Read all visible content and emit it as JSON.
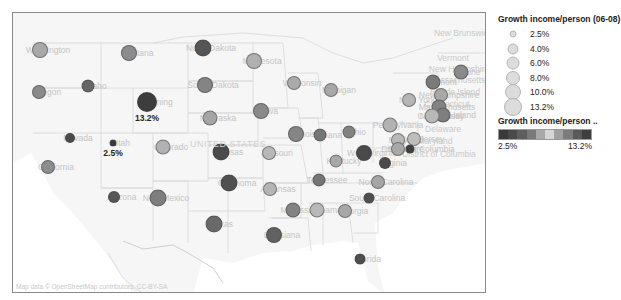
{
  "title_fragment": "Growth Income/Person — Average Growth Rate by State",
  "map": {
    "country_label": "UNITED STATES",
    "attribution": "Map data © OpenStreetMap contributors, CC-BY-SA",
    "extra_labels": [
      {
        "text": "Vermont",
        "x": 452,
        "y": 57
      },
      {
        "text": "New Hampshire",
        "x": 458,
        "y": 68
      },
      {
        "text": "Massachusetts",
        "x": 456,
        "y": 79
      },
      {
        "text": "Rhode Island",
        "x": 454,
        "y": 91
      },
      {
        "text": "Connecticut",
        "x": 446,
        "y": 103
      },
      {
        "text": "New Jersey",
        "x": 441,
        "y": 115
      },
      {
        "text": "Delaware",
        "x": 442,
        "y": 128
      },
      {
        "text": "Maryland",
        "x": 434,
        "y": 140
      },
      {
        "text": "District of Columbia",
        "x": 438,
        "y": 153
      },
      {
        "text": "New Brunswick",
        "x": 462,
        "y": 32
      }
    ],
    "states": [
      {
        "name": "Washington",
        "x": 39,
        "y": 49,
        "value": 7.0,
        "r": 8,
        "color": "#a8a8a8"
      },
      {
        "name": "Oregon",
        "x": 38,
        "y": 91,
        "value": 5.5,
        "r": 7,
        "color": "#8a8a8a"
      },
      {
        "name": "California",
        "x": 47,
        "y": 166,
        "value": 6.0,
        "r": 7,
        "color": "#8d8d8d"
      },
      {
        "name": "Nevada",
        "x": 69,
        "y": 137,
        "value": 3.5,
        "r": 5,
        "color": "#4a4a4a"
      },
      {
        "name": "Idaho",
        "x": 87,
        "y": 85,
        "value": 5.0,
        "r": 6.5,
        "color": "#656565"
      },
      {
        "name": "Montana",
        "x": 128,
        "y": 52,
        "value": 7.5,
        "r": 8,
        "color": "#8c8c8c"
      },
      {
        "name": "Wyoming",
        "x": 146,
        "y": 101,
        "value": 13.2,
        "r": 10,
        "color": "#3d3d3d",
        "label": "13.2%"
      },
      {
        "name": "Utah",
        "x": 112,
        "y": 142,
        "value": 2.5,
        "r": 3.5,
        "color": "#3a3a3a",
        "label": "2.5%"
      },
      {
        "name": "Colorado",
        "x": 162,
        "y": 146,
        "value": 7.0,
        "r": 7.5,
        "color": "#b2b2b2"
      },
      {
        "name": "Arizona",
        "x": 113,
        "y": 196,
        "value": 4.5,
        "r": 6,
        "color": "#575757"
      },
      {
        "name": "New Mexico",
        "x": 157,
        "y": 197,
        "value": 8.0,
        "r": 8.5,
        "color": "#7e7e7e"
      },
      {
        "name": "North Dakota",
        "x": 202,
        "y": 47,
        "value": 9.5,
        "r": 8.5,
        "color": "#555555"
      },
      {
        "name": "South Dakota",
        "x": 204,
        "y": 84,
        "value": 8.0,
        "r": 8,
        "color": "#848484"
      },
      {
        "name": "Nebraska",
        "x": 209,
        "y": 117,
        "value": 7.0,
        "r": 7.5,
        "color": "#a5a5a5"
      },
      {
        "name": "Kansas",
        "x": 220,
        "y": 151,
        "value": 10.0,
        "r": 8.5,
        "color": "#4a4a4a"
      },
      {
        "name": "Oklahoma",
        "x": 228,
        "y": 182,
        "value": 10.5,
        "r": 8.5,
        "color": "#505050"
      },
      {
        "name": "Texas",
        "x": 213,
        "y": 223,
        "value": 9.0,
        "r": 8.5,
        "color": "#6a6a6a"
      },
      {
        "name": "Minnesota",
        "x": 253,
        "y": 60,
        "value": 7.5,
        "r": 8,
        "color": "#b0b0b0"
      },
      {
        "name": "Iowa",
        "x": 260,
        "y": 110,
        "value": 8.0,
        "r": 8,
        "color": "#8a8a8a"
      },
      {
        "name": "Missouri",
        "x": 268,
        "y": 152,
        "value": 6.5,
        "r": 7,
        "color": "#b8b8b8"
      },
      {
        "name": "Arkansas",
        "x": 269,
        "y": 188,
        "value": 6.5,
        "r": 7,
        "color": "#b5b5b5"
      },
      {
        "name": "Louisiana",
        "x": 273,
        "y": 234,
        "value": 9.5,
        "r": 8,
        "color": "#616161"
      },
      {
        "name": "Wisconsin",
        "x": 293,
        "y": 82,
        "value": 7.0,
        "r": 7,
        "color": "#aaaaaa"
      },
      {
        "name": "Illinois",
        "x": 295,
        "y": 133,
        "value": 8.0,
        "r": 8,
        "color": "#868686"
      },
      {
        "name": "Indiana",
        "x": 319,
        "y": 134,
        "value": 6.0,
        "r": 6.5,
        "color": "#767676"
      },
      {
        "name": "Michigan",
        "x": 330,
        "y": 89,
        "value": 6.5,
        "r": 7,
        "color": "#a8a8a8"
      },
      {
        "name": "Ohio",
        "x": 348,
        "y": 131,
        "value": 6.0,
        "r": 6.5,
        "color": "#838383"
      },
      {
        "name": "Kentucky",
        "x": 335,
        "y": 160,
        "value": 6.0,
        "r": 6.5,
        "color": "#a8a8a8"
      },
      {
        "name": "Tennessee",
        "x": 318,
        "y": 179,
        "value": 6.0,
        "r": 6.5,
        "color": "#757575"
      },
      {
        "name": "Mississippi",
        "x": 292,
        "y": 209,
        "value": 8.0,
        "r": 7.5,
        "color": "#838383"
      },
      {
        "name": "Alabama",
        "x": 316,
        "y": 209,
        "value": 7.5,
        "r": 7.5,
        "color": "#b8b8b8"
      },
      {
        "name": "Georgia",
        "x": 344,
        "y": 210,
        "value": 7.0,
        "r": 7,
        "color": "#a8a8a8"
      },
      {
        "name": "Florida",
        "x": 359,
        "y": 258,
        "value": 4.5,
        "r": 5.5,
        "color": "#4e4e4e"
      },
      {
        "name": "South Carolina",
        "x": 368,
        "y": 197,
        "value": 4.5,
        "r": 5.5,
        "color": "#4e4e4e"
      },
      {
        "name": "North Carolina",
        "x": 377,
        "y": 181,
        "value": 7.0,
        "r": 7,
        "color": "#a5a5a5"
      },
      {
        "name": "Virginia",
        "x": 384,
        "y": 162,
        "value": 5.0,
        "r": 6,
        "color": "#4a4a4a"
      },
      {
        "name": "West Virginia",
        "x": 363,
        "y": 152,
        "value": 9.0,
        "r": 8,
        "color": "#4a4a4a"
      },
      {
        "name": "Pennsylvania",
        "x": 389,
        "y": 124,
        "value": 7.0,
        "r": 7.5,
        "color": "#b2b2b2"
      },
      {
        "name": "Maryland",
        "x": 397,
        "y": 139,
        "value": 6.5,
        "r": 7,
        "color": "#b8b8b8"
      },
      {
        "name": "Delaware",
        "x": 397,
        "y": 148,
        "value": 6.5,
        "r": 7,
        "color": "#a8a8a8"
      },
      {
        "name": "New Jersey",
        "x": 413,
        "y": 138,
        "value": 7.0,
        "r": 7,
        "color": "#bdbdbd"
      },
      {
        "name": "District of Columbia",
        "x": 409,
        "y": 148,
        "value": 3.5,
        "r": 4.5,
        "color": "#3f3f3f"
      },
      {
        "name": "New York",
        "x": 408,
        "y": 99,
        "value": 7.0,
        "r": 7,
        "color": "#b5b5b5"
      },
      {
        "name": "Vermont",
        "x": 432,
        "y": 81,
        "value": 7.5,
        "r": 7.5,
        "color": "#7a7a7a"
      },
      {
        "name": "New Hampshire",
        "x": 440,
        "y": 94,
        "value": 7.0,
        "r": 7,
        "color": "#a8a8a8"
      },
      {
        "name": "Massachusetts",
        "x": 438,
        "y": 106,
        "value": 8.0,
        "r": 7.5,
        "color": "#838383"
      },
      {
        "name": "Rhode Island",
        "x": 442,
        "y": 114,
        "value": 7.5,
        "r": 7.5,
        "color": "#7e7e7e"
      },
      {
        "name": "Connecticut",
        "x": 431,
        "y": 115,
        "value": 7.5,
        "r": 7.5,
        "color": "#b8b8b8"
      },
      {
        "name": "Maine",
        "x": 460,
        "y": 71,
        "value": 7.5,
        "r": 7.5,
        "color": "#8a8a8a"
      }
    ]
  },
  "size_legend": {
    "title": "Growth income/person (06-08)",
    "items": [
      {
        "label": "2.5%",
        "d": 7
      },
      {
        "label": "4.0%",
        "d": 11
      },
      {
        "label": "6.0%",
        "d": 13
      },
      {
        "label": "8.0%",
        "d": 14
      },
      {
        "label": "10.0%",
        "d": 16
      },
      {
        "label": "13.2%",
        "d": 18
      }
    ]
  },
  "color_legend": {
    "title": "Growth income/person ..",
    "min_label": "2.5%",
    "max_label": "13.2%",
    "stops": [
      "#3a3a3a",
      "#4a4a4a",
      "#5e5e5e",
      "#7a7a7a",
      "#a8a8a8",
      "#d6d6d6",
      "#a0a0a0",
      "#7c7c7c",
      "#5a5a5a",
      "#3e3e3e"
    ]
  }
}
